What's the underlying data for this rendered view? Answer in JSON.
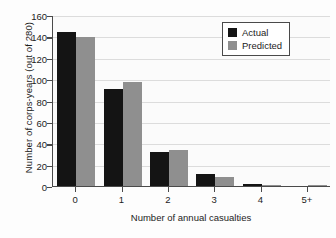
{
  "chart_data": {
    "type": "bar",
    "title": "",
    "xlabel": "Number of annual casualties",
    "ylabel": "Number of corps-years (out of 280)",
    "categories": [
      "0",
      "1",
      "2",
      "3",
      "4",
      "5+"
    ],
    "series": [
      {
        "name": "Actual",
        "color": "#141414",
        "values": [
          144,
          91,
          32,
          11,
          2,
          0
        ]
      },
      {
        "name": "Predicted",
        "color": "#8f8f8f",
        "values": [
          139,
          97,
          34,
          8,
          1,
          1
        ]
      }
    ],
    "ylim": [
      0,
      160
    ],
    "yticks": [
      0,
      20,
      40,
      60,
      80,
      100,
      120,
      140,
      160
    ],
    "ytick_labels": [
      "0",
      "20",
      "40",
      "60",
      "80",
      "100",
      "120",
      "140",
      "160"
    ],
    "grid": true,
    "legend_position": "top-right",
    "legend_entries": [
      "Actual",
      "Predicted"
    ]
  }
}
